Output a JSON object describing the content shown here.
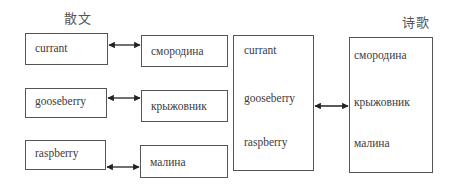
{
  "headings": {
    "prose": "散文",
    "poetry": "诗歌"
  },
  "prose_pairs": [
    {
      "english": "currant",
      "russian": "смородина"
    },
    {
      "english": "gooseberry",
      "russian": "крыжовник"
    },
    {
      "english": "raspberry",
      "russian": "малина"
    }
  ],
  "poetry_group": {
    "english": [
      "currant",
      "gooseberry",
      "raspberry"
    ],
    "russian": [
      "смородина",
      "крыжовник",
      "малина"
    ]
  },
  "colors": {
    "stroke": "#555555",
    "text": "#3c3c3c",
    "arrow": "#222222"
  }
}
